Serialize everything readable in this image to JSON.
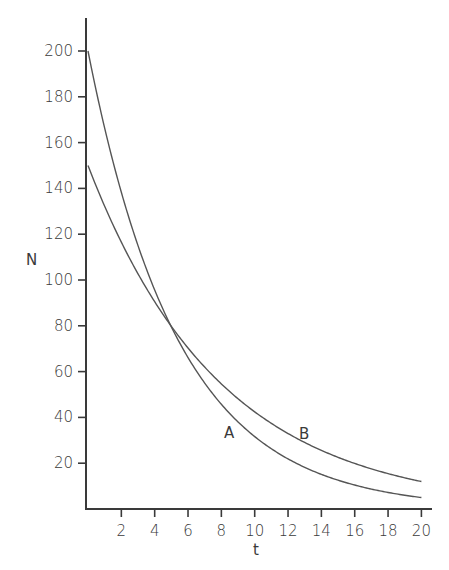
{
  "chart_data": {
    "type": "line",
    "title": "",
    "xlabel": "t",
    "ylabel": "N",
    "xlim": [
      0,
      20
    ],
    "ylim": [
      0,
      210
    ],
    "grid": false,
    "legend": "none (curves labeled inline)",
    "x_ticks": [
      2,
      4,
      6,
      8,
      10,
      12,
      14,
      16,
      18,
      20
    ],
    "y_ticks": [
      20,
      40,
      60,
      80,
      100,
      120,
      140,
      160,
      180,
      200
    ],
    "x": [
      0,
      2,
      4,
      6,
      8,
      10,
      12,
      14,
      16,
      18,
      20
    ],
    "series": [
      {
        "name": "A",
        "values": [
          200,
          138.5,
          95.8,
          66.3,
          45.9,
          31.8,
          22.0,
          15.2,
          10.5,
          7.3,
          5.0
        ],
        "label_at": [
          8.5,
          38
        ]
      },
      {
        "name": "B",
        "values": [
          150,
          116.6,
          90.6,
          70.4,
          54.7,
          42.5,
          33.0,
          25.7,
          20.0,
          15.5,
          12.0
        ],
        "label_at": [
          13,
          36
        ]
      }
    ],
    "annotations": [
      "Curves A and B intersect near t≈5, N≈80"
    ]
  },
  "labels": {
    "xlabel": "t",
    "ylabel": "N",
    "curve_a": "A",
    "curve_b": "B"
  }
}
